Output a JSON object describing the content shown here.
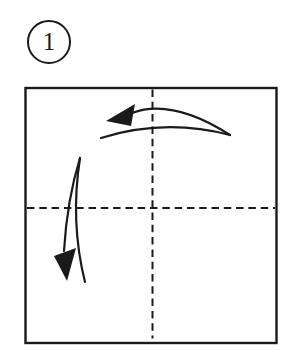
{
  "step": {
    "number": "1"
  },
  "colors": {
    "line": "#1a1a1a",
    "paper": "#ffffff"
  },
  "icons": {
    "step_badge": "circled-number-badge",
    "top_arrow": "fold-right-half-to-left-arrow",
    "left_arrow": "fold-top-half-down-arrow",
    "vertical_crease": "vertical-center-valley-fold-dashed-line",
    "horizontal_crease": "horizontal-center-valley-fold-dashed-line"
  }
}
